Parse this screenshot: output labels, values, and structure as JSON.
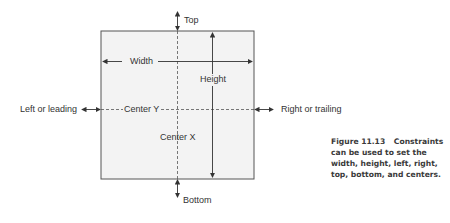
{
  "diagram": {
    "labels": {
      "top": "Top",
      "bottom": "Bottom",
      "width": "Width",
      "height": "Height",
      "left": "Left or leading",
      "right": "Right or trailing",
      "center_x": "Center X",
      "center_y": "Center Y"
    },
    "colors": {
      "box_fill": "#f3f3f3",
      "box_stroke": "#555555",
      "arrow": "#333333",
      "dashed": "#555555"
    }
  },
  "caption": {
    "figure_number": "Figure 11.13",
    "text": "Constraints can be used to set the width, height, left, right, top, bottom, and centers."
  }
}
